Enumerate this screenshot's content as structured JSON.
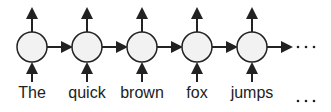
{
  "diagram": {
    "type": "unrolled-rnn",
    "tokens": [
      "The",
      "quick",
      "brown",
      "fox",
      "jumps"
    ],
    "continuation": "...",
    "colors": {
      "stroke": "#222222",
      "node_fill": "#f2f2f2"
    }
  }
}
